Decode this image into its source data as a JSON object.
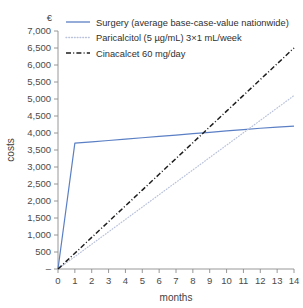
{
  "chart_data": {
    "type": "line",
    "title": "",
    "xlabel": "months",
    "ylabel": "costs",
    "yunit": "€",
    "xlim": [
      0,
      14
    ],
    "ylim": [
      0,
      7000
    ],
    "grid": false,
    "legend_position": "top-right",
    "x": [
      0,
      1,
      2,
      3,
      4,
      5,
      6,
      7,
      8,
      9,
      10,
      11,
      12,
      13,
      14
    ],
    "xticklabels": [
      "0",
      "1",
      "2",
      "3",
      "4",
      "5",
      "6",
      "7",
      "8",
      "9",
      "10",
      "11",
      "12",
      "13",
      "14"
    ],
    "yticks": [
      0,
      500,
      1000,
      1500,
      2000,
      2500,
      3000,
      3500,
      4000,
      4500,
      5000,
      5500,
      6000,
      6500,
      7000
    ],
    "yticklabels": [
      "–",
      "500",
      "1,000",
      "1,500",
      "2,000",
      "2,500",
      "3,000",
      "3,500",
      "4,000",
      "4,500",
      "5,000",
      "5,500",
      "6,000",
      "6,500",
      "7,000"
    ],
    "series": [
      {
        "name": "Surgery  (average base-case-value nationwide)",
        "style": "solid",
        "color": "#5b7fc4",
        "values": [
          0,
          3700,
          3740,
          3780,
          3820,
          3860,
          3900,
          3940,
          3980,
          4020,
          4060,
          4100,
          4140,
          4170,
          4200
        ]
      },
      {
        "name": "Paricalcitol  (5 µg/mL)  3×1 mL/week",
        "style": "dotted",
        "color": "#b9c2da",
        "values": [
          0,
          364,
          729,
          1093,
          1457,
          1821,
          2186,
          2550,
          2914,
          3279,
          3643,
          4007,
          4371,
          4736,
          5100
        ]
      },
      {
        "name": "Cinacalcet 60 mg/day",
        "style": "dashdot",
        "color": "#1e1e1e",
        "values": [
          0,
          464,
          929,
          1393,
          1857,
          2321,
          2786,
          3250,
          3714,
          4179,
          4643,
          5107,
          5571,
          6036,
          6500
        ]
      }
    ]
  }
}
